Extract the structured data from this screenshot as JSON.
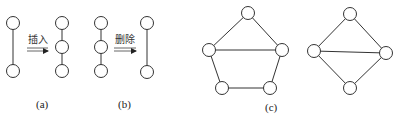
{
  "figure": {
    "panels": [
      {
        "id": "a",
        "label": "(a)",
        "operation": "插入",
        "before": {
          "nodes": [
            [
              13,
              23
            ],
            [
              13,
              71
            ]
          ],
          "edges": [
            [
              0,
              1
            ]
          ]
        },
        "after": {
          "nodes": [
            [
              62,
              23
            ],
            [
              62,
              47
            ],
            [
              62,
              71
            ]
          ],
          "edges": [
            [
              0,
              1
            ],
            [
              1,
              2
            ]
          ]
        }
      },
      {
        "id": "b",
        "label": "(b)",
        "operation": "删除",
        "before": {
          "nodes": [
            [
              101,
              23
            ],
            [
              101,
              47
            ],
            [
              101,
              71
            ]
          ],
          "edges": [
            [
              0,
              1
            ],
            [
              1,
              2
            ]
          ]
        },
        "after": {
          "nodes": [
            [
              147,
              23
            ],
            [
              147,
              72
            ]
          ],
          "edges": [
            [
              0,
              1
            ]
          ]
        }
      },
      {
        "id": "c",
        "label": "(c)",
        "graphs": [
          {
            "name": "pentagon",
            "nodes": [
              [
                248,
                13
              ],
              [
                209,
                50
              ],
              [
                282,
                50
              ],
              [
                222,
                88
              ],
              [
                270,
                88
              ]
            ],
            "edges": [
              [
                0,
                1
              ],
              [
                0,
                2
              ],
              [
                1,
                2
              ],
              [
                1,
                3
              ],
              [
                2,
                4
              ],
              [
                3,
                4
              ]
            ]
          },
          {
            "name": "diamond",
            "nodes": [
              [
                350,
                14
              ],
              [
                314,
                51
              ],
              [
                386,
                53
              ],
              [
                350,
                88
              ]
            ],
            "edges": [
              [
                0,
                1
              ],
              [
                0,
                2
              ],
              [
                1,
                2
              ],
              [
                1,
                3
              ],
              [
                2,
                3
              ]
            ]
          }
        ]
      }
    ]
  },
  "labels": {
    "a": "(a)",
    "b": "(b)",
    "c": "(c)",
    "insert": "插入",
    "delete": "删除"
  }
}
